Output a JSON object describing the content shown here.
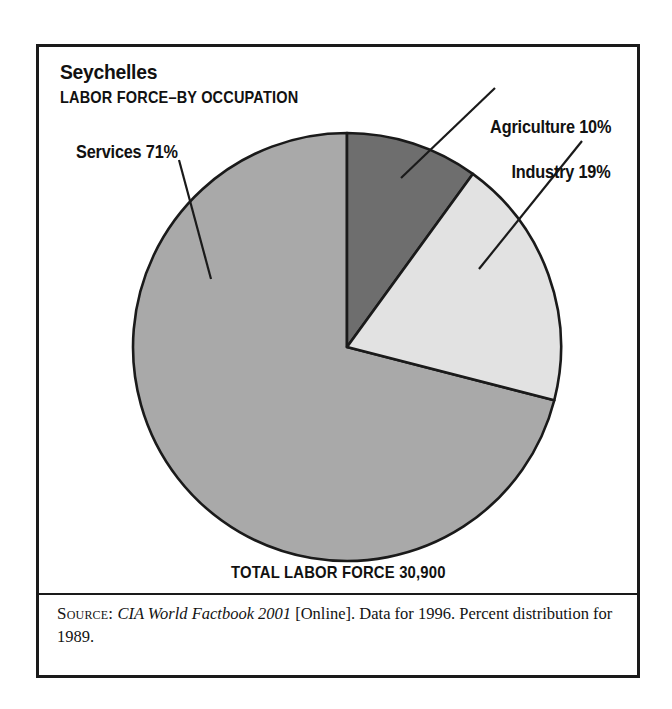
{
  "figure": {
    "title": "Seychelles",
    "subtitle": "LABOR FORCE–BY OCCUPATION",
    "total_caption": "TOTAL LABOR FORCE 30,900"
  },
  "labels": {
    "services": "Services 71%",
    "agriculture": "Agriculture 10%",
    "industry": "Industry 19%"
  },
  "source": {
    "label": "Source:",
    "work": "CIA World Factbook 2001",
    "rest": " [Online]. Data for 1996. Percent distribution for 1989."
  },
  "colors": {
    "agriculture": "#6e6e6e",
    "industry": "#e2e2e2",
    "services": "#a9a9a9",
    "outline": "#1a1a1a",
    "frame": "#1a1a1a",
    "text": "#111111"
  },
  "chart_data": {
    "type": "pie",
    "subtitle": "LABOR FORCE–BY OCCUPATION",
    "unit": "percent",
    "total_label": "TOTAL LABOR FORCE 30,900",
    "total_value": 30900,
    "start_angle_deg": 0,
    "direction": "clockwise",
    "categories": [
      "Agriculture",
      "Industry",
      "Services"
    ],
    "values": [
      10,
      19,
      71
    ],
    "slices": [
      {
        "name": "Agriculture",
        "value": 10,
        "label": "Agriculture 10%",
        "color": "#6e6e6e",
        "start_deg": 0,
        "end_deg": 36
      },
      {
        "name": "Industry",
        "value": 19,
        "label": "Industry 19%",
        "color": "#e2e2e2",
        "start_deg": 36,
        "end_deg": 104.4
      },
      {
        "name": "Services",
        "value": 71,
        "label": "Services 71%",
        "color": "#a9a9a9",
        "start_deg": 104.4,
        "end_deg": 360
      }
    ],
    "legend": "none",
    "labels_position": "callout-leader-lines",
    "grid": false,
    "source_note": "SOURCE: CIA World Factbook 2001 [Online]. Data for 1996. Percent distribution for 1989."
  }
}
